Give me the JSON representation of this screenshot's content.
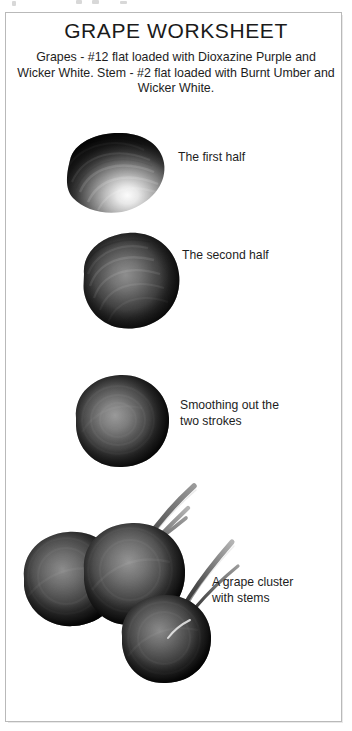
{
  "page": {
    "title": "GRAPE WORKSHEET",
    "subtitle": "Grapes - #12 flat loaded with Dioxazine Purple and Wicker White. Stem - #2 flat loaded with Burnt Umber and Wicker White."
  },
  "steps": [
    {
      "id": "step-1",
      "label": "The first half",
      "art_name": "grape-first-half-stroke"
    },
    {
      "id": "step-2",
      "label": "The second half",
      "art_name": "grape-second-half-stroke"
    },
    {
      "id": "step-3",
      "label": "Smoothing out the\ntwo strokes",
      "art_name": "grape-smoothed"
    },
    {
      "id": "step-4",
      "label": "A grape cluster\nwith stems",
      "art_name": "grape-cluster-with-stems"
    }
  ],
  "colors": {
    "paper": "#ffffff",
    "border": "#b9b9b9",
    "text": "#1d1d1d",
    "grape_dark": "#111111",
    "grape_mid": "#3a3a3a",
    "grape_light": "#c9c9c9",
    "highlight": "#f4f4f4",
    "stem_dark": "#2a2a2a"
  }
}
